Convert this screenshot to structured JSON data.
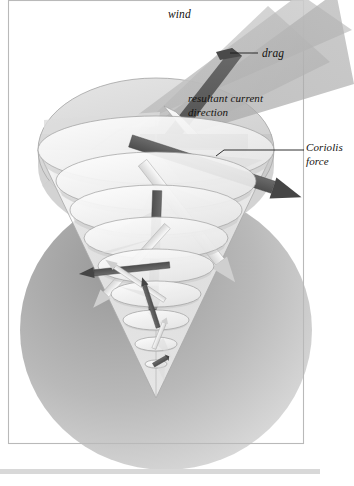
{
  "figure": {
    "kind": "scientific-illustration",
    "background_color": "#ffffff",
    "plate_color": "#fbfbfa",
    "frame_color": "#b9b9b9",
    "caption_rule_color": "#d8d8d8"
  },
  "labels": {
    "wind": "wind",
    "drag": "drag",
    "resultant_line1": "resultant current",
    "resultant_line2": "direction",
    "coriolis_line1": "Coriolis",
    "coriolis_line2": "force"
  },
  "palette": {
    "wind_band_light": "#c9c9c9",
    "wind_band_mid": "#a9a9a9",
    "wind_band_dark": "#9a9a9a",
    "ocean_disc_light": "#e3e3e3",
    "ocean_disc_mid": "#cfcfcf",
    "arrow_dark": "#5c5c5c",
    "arrow_darker": "#4a4a4a",
    "arrow_light": "#efefef",
    "arrow_edge": "#8a8a8a",
    "cone_fill": "#fdfdfd",
    "cone_stroke": "#9a9a9a",
    "shadow_sphere": "#9e9e9e",
    "label_color": "#14120f"
  },
  "chart_data": {
    "type": "diagram",
    "annotations": [
      {
        "name": "wind",
        "text": "wind",
        "x": 168,
        "y": 16,
        "leader": false
      },
      {
        "name": "drag",
        "text": "drag",
        "x": 262,
        "y": 56,
        "leader": true,
        "leader_from_x": 232,
        "leader_to_x": 258,
        "leader_y": 53
      },
      {
        "name": "resultant-current-direction",
        "text": "resultant current direction",
        "x": 188,
        "y": 100,
        "leader": false
      },
      {
        "name": "coriolis-force",
        "text": "Coriolis force",
        "x": 306,
        "y": 150,
        "leader": true,
        "leader_from_x": 224,
        "leader_to_x": 304,
        "leader_y": 150
      }
    ],
    "spiral_layers": [
      {
        "index": 0,
        "depth_level": "surface",
        "cy": 150,
        "rx": 118,
        "ry": 34,
        "arrow_angle_deg": 18,
        "arrow_len": 150,
        "shade": "dark"
      },
      {
        "index": 1,
        "depth_level": "layer-1",
        "cy": 181,
        "rx": 100,
        "ry": 29,
        "arrow_angle_deg": 52,
        "arrow_len": 126,
        "shade": "light"
      },
      {
        "index": 2,
        "depth_level": "layer-2",
        "cy": 210,
        "rx": 86,
        "ry": 25,
        "arrow_angle_deg": 92,
        "arrow_len": 108,
        "shade": "dark"
      },
      {
        "index": 3,
        "depth_level": "layer-3",
        "cy": 238,
        "rx": 72,
        "ry": 21,
        "arrow_angle_deg": 132,
        "arrow_len": 92,
        "shade": "light"
      },
      {
        "index": 4,
        "depth_level": "layer-4",
        "cy": 266,
        "rx": 58,
        "ry": 17,
        "arrow_angle_deg": 174,
        "arrow_len": 76,
        "shade": "dark"
      },
      {
        "index": 5,
        "depth_level": "layer-5",
        "cy": 294,
        "rx": 45,
        "ry": 13,
        "arrow_angle_deg": 214,
        "arrow_len": 60,
        "shade": "light"
      },
      {
        "index": 6,
        "depth_level": "layer-6",
        "cy": 320,
        "rx": 33,
        "ry": 10,
        "arrow_angle_deg": 252,
        "arrow_len": 44,
        "shade": "dark"
      },
      {
        "index": 7,
        "depth_level": "layer-7",
        "cy": 344,
        "rx": 21,
        "ry": 7,
        "arrow_angle_deg": 292,
        "arrow_len": 28,
        "shade": "light"
      },
      {
        "index": 8,
        "depth_level": "deepest",
        "cy": 364,
        "rx": 11,
        "ry": 4,
        "arrow_angle_deg": 330,
        "arrow_len": 15,
        "shade": "dark"
      }
    ],
    "cone": {
      "apex_x": 156,
      "apex_y": 398,
      "top_cy": 150,
      "top_rx": 118
    },
    "wind_bands": [
      {
        "name": "upper-wind-band",
        "shade": "#c2c2c2"
      },
      {
        "name": "mid-wind-band",
        "shade": "#a9a9a9"
      },
      {
        "name": "lower-wind-band",
        "shade": "#bdbdbd"
      }
    ]
  }
}
